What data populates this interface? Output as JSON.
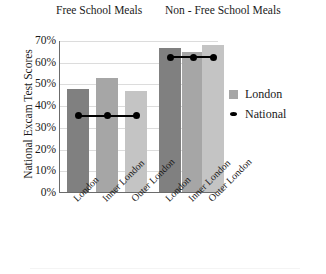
{
  "chart_data": {
    "type": "bar",
    "title": "",
    "xlabel": "",
    "ylabel": "National Excam Test Scores",
    "ylim": [
      0,
      70
    ],
    "ytick_labels": [
      "0%",
      "10%",
      "20%",
      "30%",
      "40%",
      "50%",
      "60%",
      "70%"
    ],
    "ytick_values": [
      0,
      10,
      20,
      30,
      40,
      50,
      60,
      70
    ],
    "grid": true,
    "legend_position": "right",
    "group_titles": [
      "Free School Meals",
      "Non - Free School Meals"
    ],
    "categories": [
      "London",
      "Inner London",
      "Outer London",
      "London",
      "Inner London",
      "Outer London"
    ],
    "series": [
      {
        "name": "London",
        "type": "bar",
        "values": [
          47.5,
          52.5,
          46.5,
          66.5,
          64.5,
          67.5
        ]
      },
      {
        "name": "National",
        "type": "line",
        "values": [
          35.5,
          35.5,
          35.5,
          62.5,
          62.5,
          62.5
        ]
      }
    ],
    "bar_colors": [
      "#808080",
      "#a6a6a6",
      "#c4c4c4",
      "#808080",
      "#a6a6a6",
      "#c4c4c4"
    ],
    "national_color": "#000000"
  },
  "legend": {
    "items": [
      {
        "label": "London",
        "marker": "square-swatch"
      },
      {
        "label": "National",
        "marker": "diamond-marker"
      }
    ]
  }
}
